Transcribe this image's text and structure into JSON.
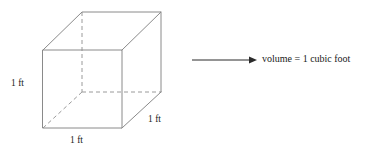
{
  "figure": {
    "shape": {
      "name": "cube",
      "edge_color": "#8a8a8a",
      "hidden_edge_color": "#9a9a9a",
      "labels": {
        "height": "1 ft",
        "width": "1 ft",
        "depth": "1 ft"
      }
    },
    "arrow": {
      "name": "rightwards-arrow",
      "color": "#2b2b2b"
    },
    "caption": {
      "text": "volume = 1 cubic foot"
    }
  }
}
